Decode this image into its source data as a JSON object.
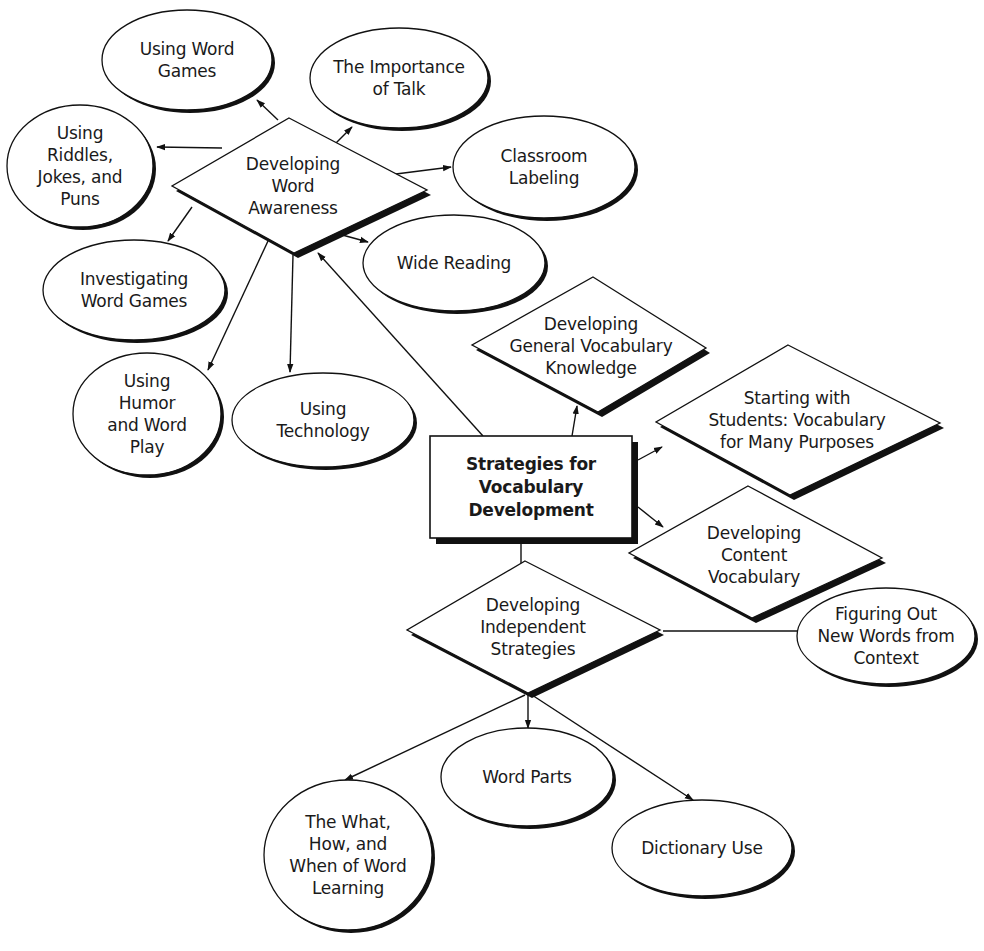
{
  "diagram": {
    "colors": {
      "stroke": "#111111",
      "shadow": "#111111",
      "fill": "#ffffff",
      "text": "#1a1a1a"
    },
    "central": {
      "id": "central",
      "shape": "box",
      "lines": [
        "Strategies for",
        "Vocabulary",
        "Development"
      ],
      "x": 430,
      "y": 436,
      "w": 202,
      "h": 102
    },
    "diamonds": [
      {
        "id": "word-awareness",
        "lines": [
          "Developing",
          "Word",
          "Awareness"
        ],
        "top": [
          289,
          118
        ],
        "left": [
          172,
          186
        ],
        "right": [
          427,
          190
        ],
        "bottom": [
          294,
          253
        ],
        "cx": 293,
        "cy": 186
      },
      {
        "id": "general-vocabulary",
        "lines": [
          "Developing",
          "General Vocabulary",
          "Knowledge"
        ],
        "top": [
          593,
          277
        ],
        "left": [
          472,
          345
        ],
        "right": [
          706,
          348
        ],
        "bottom": [
          598,
          412
        ],
        "cx": 591,
        "cy": 346
      },
      {
        "id": "starting-with-students",
        "lines": [
          "Starting with",
          "Students: Vocabulary",
          "for Many Purposes"
        ],
        "top": [
          788,
          345
        ],
        "left": [
          656,
          422
        ],
        "right": [
          940,
          423
        ],
        "bottom": [
          790,
          495
        ],
        "cx": 797,
        "cy": 420
      },
      {
        "id": "content-vocabulary",
        "lines": [
          "Developing",
          "Content",
          "Vocabulary"
        ],
        "top": [
          748,
          486
        ],
        "left": [
          629,
          553
        ],
        "right": [
          882,
          558
        ],
        "bottom": [
          752,
          618
        ],
        "cx": 754,
        "cy": 555
      },
      {
        "id": "independent-strategies",
        "lines": [
          "Developing",
          "Independent",
          "Strategies"
        ],
        "top": [
          525,
          561
        ],
        "left": [
          407,
          630
        ],
        "right": [
          660,
          630
        ],
        "bottom": [
          528,
          693
        ],
        "cx": 533,
        "cy": 627
      }
    ],
    "ellipses": [
      {
        "id": "using-word-games",
        "lines": [
          "Using Word",
          "Games"
        ],
        "cx": 187,
        "cy": 60,
        "rx": 85,
        "ry": 50
      },
      {
        "id": "importance-of-talk",
        "lines": [
          "The Importance",
          "of Talk"
        ],
        "cx": 399,
        "cy": 78,
        "rx": 89,
        "ry": 50
      },
      {
        "id": "riddles-jokes-puns",
        "lines": [
          "Using",
          "Riddles,",
          "Jokes, and",
          "Puns"
        ],
        "cx": 80,
        "cy": 166,
        "rx": 73,
        "ry": 61
      },
      {
        "id": "classroom-labeling",
        "lines": [
          "Classroom",
          "Labeling"
        ],
        "cx": 544,
        "cy": 167,
        "rx": 91,
        "ry": 51
      },
      {
        "id": "wide-reading",
        "lines": [
          "Wide Reading"
        ],
        "cx": 454,
        "cy": 263,
        "rx": 91,
        "ry": 48
      },
      {
        "id": "investigating-word-games",
        "lines": [
          "Investigating",
          "Word Games"
        ],
        "cx": 134,
        "cy": 290,
        "rx": 91,
        "ry": 50
      },
      {
        "id": "humor-word-play",
        "lines": [
          "Using",
          "Humor",
          "and Word",
          "Play"
        ],
        "cx": 147,
        "cy": 414,
        "rx": 74,
        "ry": 61
      },
      {
        "id": "using-technology",
        "lines": [
          "Using",
          "Technology"
        ],
        "cx": 323,
        "cy": 420,
        "rx": 91,
        "ry": 47
      },
      {
        "id": "figuring-out-new-words",
        "lines": [
          "Figuring Out",
          "New Words from",
          "Context"
        ],
        "cx": 886,
        "cy": 636,
        "rx": 89,
        "ry": 48
      },
      {
        "id": "word-parts",
        "lines": [
          "Word Parts"
        ],
        "cx": 527,
        "cy": 777,
        "rx": 86,
        "ry": 49
      },
      {
        "id": "what-how-when",
        "lines": [
          "The What,",
          "How, and",
          "When of Word",
          "Learning"
        ],
        "cx": 348,
        "cy": 855,
        "rx": 84,
        "ry": 75
      },
      {
        "id": "dictionary-use",
        "lines": [
          "Dictionary Use"
        ],
        "cx": 702,
        "cy": 848,
        "rx": 90,
        "ry": 48
      }
    ],
    "connectors": [
      {
        "from": "word-awareness",
        "to": "using-word-games",
        "x1": 278,
        "y1": 120,
        "x2": 257,
        "y2": 100,
        "arrow": true
      },
      {
        "from": "word-awareness",
        "to": "importance-of-talk",
        "x1": 332,
        "y1": 147,
        "x2": 352,
        "y2": 127,
        "arrow": true
      },
      {
        "from": "word-awareness",
        "to": "riddles-jokes-puns",
        "x1": 222,
        "y1": 148,
        "x2": 157,
        "y2": 147,
        "arrow": true
      },
      {
        "from": "word-awareness",
        "to": "classroom-labeling",
        "x1": 388,
        "y1": 175,
        "x2": 451,
        "y2": 167,
        "arrow": true
      },
      {
        "from": "word-awareness",
        "to": "wide-reading",
        "x1": 335,
        "y1": 233,
        "x2": 368,
        "y2": 242,
        "arrow": true
      },
      {
        "from": "word-awareness",
        "to": "investigating-word-games",
        "x1": 192,
        "y1": 207,
        "x2": 168,
        "y2": 241,
        "arrow": true
      },
      {
        "from": "word-awareness",
        "to": "humor-word-play",
        "x1": 268,
        "y1": 241,
        "x2": 208,
        "y2": 370,
        "arrow": true
      },
      {
        "from": "word-awareness",
        "to": "using-technology",
        "x1": 293,
        "y1": 255,
        "x2": 290,
        "y2": 372,
        "arrow": true
      },
      {
        "from": "central",
        "to": "word-awareness",
        "x1": 483,
        "y1": 436,
        "x2": 318,
        "y2": 253,
        "arrow": true
      },
      {
        "from": "central",
        "to": "general-vocabulary",
        "x1": 572,
        "y1": 436,
        "x2": 577,
        "y2": 406,
        "arrow": true
      },
      {
        "from": "central",
        "to": "starting-with-students",
        "x1": 638,
        "y1": 460,
        "x2": 662,
        "y2": 447,
        "arrow": true,
        "mid": [
          [
            638,
            460
          ],
          [
            665,
            448
          ]
        ]
      },
      {
        "from": "central",
        "to": "content-vocabulary",
        "x1": 638,
        "y1": 507,
        "x2": 663,
        "y2": 527,
        "arrow": true
      },
      {
        "from": "central",
        "to": "independent-strategies",
        "x1": 521,
        "y1": 544,
        "x2": 521,
        "y2": 563,
        "arrow": false
      },
      {
        "from": "independent-strategies",
        "to": "figuring-out-new-words",
        "x1": 663,
        "y1": 631,
        "x2": 797,
        "y2": 631,
        "arrow": false
      },
      {
        "from": "independent-strategies",
        "to": "what-how-when",
        "x1": 525,
        "y1": 695,
        "x2": 345,
        "y2": 780,
        "arrow": true
      },
      {
        "from": "independent-strategies",
        "to": "word-parts",
        "x1": 528,
        "y1": 695,
        "x2": 528,
        "y2": 728,
        "arrow": true
      },
      {
        "from": "independent-strategies",
        "to": "dictionary-use",
        "x1": 532,
        "y1": 695,
        "x2": 693,
        "y2": 800,
        "arrow": true
      }
    ]
  }
}
